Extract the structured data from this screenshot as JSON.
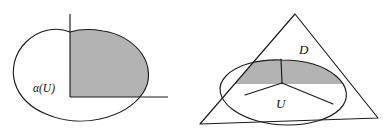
{
  "figure": {
    "background_color": "#ffffff",
    "stroke_color": "#1b1b1b",
    "shade_color": "#b3b3b3",
    "panels": [
      {
        "id": "left-panel",
        "name": "alpha-image-panel",
        "description": "Closed blob crossed by two axes with the first-quadrant portion shaded",
        "labels": [
          {
            "id": "alpha-u",
            "text": "α(U)",
            "x": 46,
            "y": 92
          }
        ],
        "axes": [
          {
            "id": "vertical-axis",
            "x1": 70,
            "y1": 14,
            "x2": 70,
            "y2": 97
          },
          {
            "id": "horizontal-axis",
            "x1": 70,
            "y1": 97,
            "x2": 168,
            "y2": 97
          }
        ]
      },
      {
        "id": "right-panel",
        "name": "triangle-ellipse-panel",
        "description": "Triangle overlapping an ellipse with the upper lens region shaded",
        "labels": [
          {
            "id": "d-label",
            "text": "D",
            "x": 303,
            "y": 53
          },
          {
            "id": "u-label",
            "text": "U",
            "x": 279,
            "y": 108
          }
        ],
        "triangle": {
          "apex": {
            "x": 295,
            "y": 14
          },
          "left_vertex": {
            "x": 200,
            "y": 124
          },
          "right_vertex": {
            "x": 378,
            "y": 118
          }
        },
        "junction_point": {
          "x": 282,
          "y": 83
        }
      }
    ]
  }
}
